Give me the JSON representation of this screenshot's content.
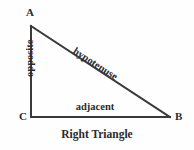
{
  "figure": {
    "caption": "Right Triangle",
    "background_color": "#fefefe",
    "stroke_color": "#3a3a3a",
    "text_color": "#2b2b2b"
  },
  "vertices": {
    "a": {
      "label": "A",
      "x": 31,
      "y": 26
    },
    "b": {
      "label": "B",
      "x": 170,
      "y": 117
    },
    "c": {
      "label": "C",
      "x": 31,
      "y": 117
    }
  },
  "sides": {
    "opposite": {
      "label": "opposite",
      "from": "A",
      "to": "C",
      "rotation_deg": -90
    },
    "hypotenuse": {
      "label": "hypotenuse",
      "from": "A",
      "to": "B",
      "rotation_deg": 32.9
    },
    "adjacent": {
      "label": "adjacent",
      "from": "C",
      "to": "B",
      "rotation_deg": 0
    }
  },
  "geometry": {
    "right_angle_vertex": "C",
    "stroke_width": 2
  }
}
